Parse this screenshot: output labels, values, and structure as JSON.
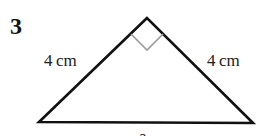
{
  "question": {
    "number": "3"
  },
  "triangle": {
    "type": "right isosceles",
    "side_left_label": "4 cm",
    "side_right_label": "4 cm",
    "base_label": "a",
    "right_angle_at": "apex",
    "stroke_color": "#111111",
    "marker_color": "#9a9a9a"
  }
}
